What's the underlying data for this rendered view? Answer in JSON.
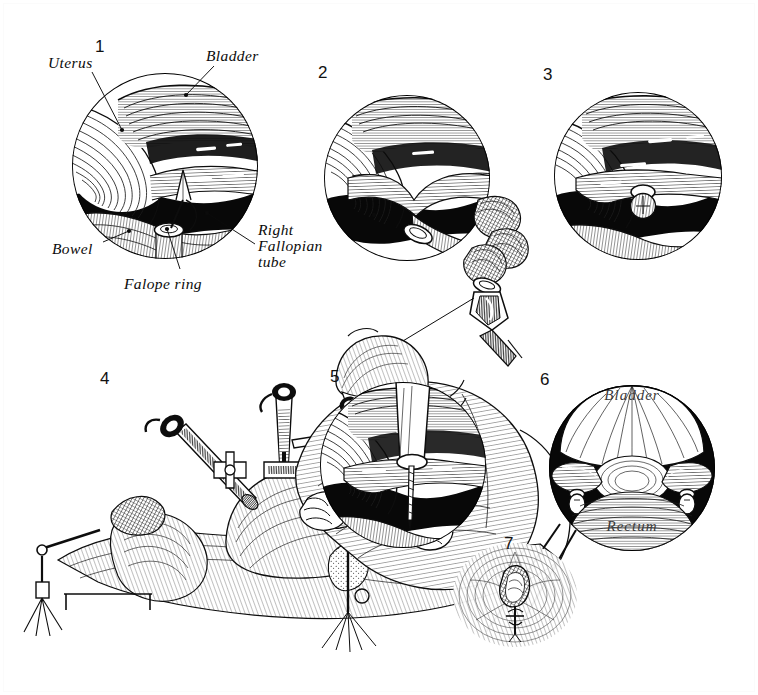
{
  "plate": {
    "title": "Laparoscopic Falope Ring Tubal Ligation",
    "medium": "pen-and-ink crosshatch line illustration",
    "background_color": "#ffffff",
    "ink_color": "#0d0d0d",
    "width": 758,
    "height": 695,
    "panel_count": 7
  },
  "panels": [
    {
      "id": "panel-1",
      "number": "1",
      "number_pos": {
        "x": 95,
        "y": 38
      },
      "shape": "circle",
      "circle": {
        "cx": 165,
        "cy": 166,
        "r": 93
      },
      "caption": "Laparoscopic view of uterus, bladder and bowel with Falope ring applicator approaching the right fallopian tube",
      "labels": [
        {
          "name": "uterus",
          "text": "Uterus",
          "text_pos": {
            "x": 48,
            "y": 55
          },
          "leader": {
            "x1": 92,
            "y1": 72,
            "x2": 122,
            "y2": 130
          },
          "dot": {
            "x": 122,
            "y": 130
          }
        },
        {
          "name": "bladder",
          "text": "Bladder",
          "text_pos": {
            "x": 206,
            "y": 48
          },
          "leader": {
            "x1": 214,
            "y1": 66,
            "x2": 186,
            "y2": 95
          },
          "dot": {
            "x": 186,
            "y": 95
          }
        },
        {
          "name": "bowel",
          "text": "Bowel",
          "text_pos": {
            "x": 52,
            "y": 241
          },
          "leader": {
            "x1": 103,
            "y1": 242,
            "x2": 129,
            "y2": 231
          },
          "dot": {
            "x": 129,
            "y": 231
          }
        },
        {
          "name": "falope-ring",
          "text": "Falope ring",
          "text_pos": {
            "x": 124,
            "y": 276
          },
          "leader": {
            "x1": 180,
            "y1": 269,
            "x2": 167,
            "y2": 229
          },
          "dot": {
            "x": 167,
            "y": 229
          }
        },
        {
          "name": "right-fallopian-tube",
          "text": "Right\nFallopian\ntube",
          "text_pos": {
            "x": 258,
            "y": 224
          },
          "leader": {
            "x1": 255,
            "y1": 244,
            "x2": 207,
            "y2": 213
          },
          "dot": {
            "x": 207,
            "y": 213
          }
        }
      ]
    },
    {
      "id": "panel-2",
      "number": "2",
      "number_pos": {
        "x": 318,
        "y": 64
      },
      "shape": "circle",
      "circle": {
        "cx": 407,
        "cy": 178,
        "r": 83
      },
      "caption": "Fallopian tube drawn up into the applicator sleeve by the grasping forceps, loop formed",
      "labels": []
    },
    {
      "id": "panel-3",
      "number": "3",
      "number_pos": {
        "x": 543,
        "y": 66
      },
      "shape": "circle",
      "circle": {
        "cx": 638,
        "cy": 176,
        "r": 84
      },
      "caption": "Falope ring released onto the base of the knuckle of tube, occluding the lumen",
      "labels": []
    },
    {
      "id": "panel-4",
      "number": "4",
      "number_pos": {
        "x": 100,
        "y": 370
      },
      "shape": "freeform",
      "caption": "Surgeon operating the laparoscope and applicator; patient in lithotomy position with uterine manipulator",
      "labels": []
    },
    {
      "id": "panel-5",
      "number": "5",
      "number_pos": {
        "x": 330,
        "y": 368
      },
      "shape": "circle",
      "circle": {
        "cx": 403,
        "cy": 465,
        "r": 83
      },
      "caption": "Applicator sleeve advanced against the tube; needle probe visible below",
      "labels": []
    },
    {
      "id": "panel-6",
      "number": "6",
      "number_pos": {
        "x": 540,
        "y": 371
      },
      "shape": "circle",
      "circle": {
        "cx": 632,
        "cy": 468,
        "r": 83
      },
      "caption": "Completed bilateral tubal occlusion — both Falope rings in place, bladder above and rectum below",
      "labels": [
        {
          "name": "bladder-inked",
          "text": "Bladder",
          "text_pos": {
            "x": 600,
            "y": 400
          },
          "inked": true
        },
        {
          "name": "rectum-inked",
          "text": "Rectum",
          "text_pos": {
            "x": 600,
            "y": 531
          },
          "inked": true
        }
      ]
    },
    {
      "id": "panel-7",
      "number": "7",
      "number_pos": {
        "x": 504,
        "y": 535
      },
      "shape": "freeform",
      "caption": "Sub-umbilical puncture site closed with a single suture after withdrawal of the laparoscope",
      "labels": []
    }
  ]
}
